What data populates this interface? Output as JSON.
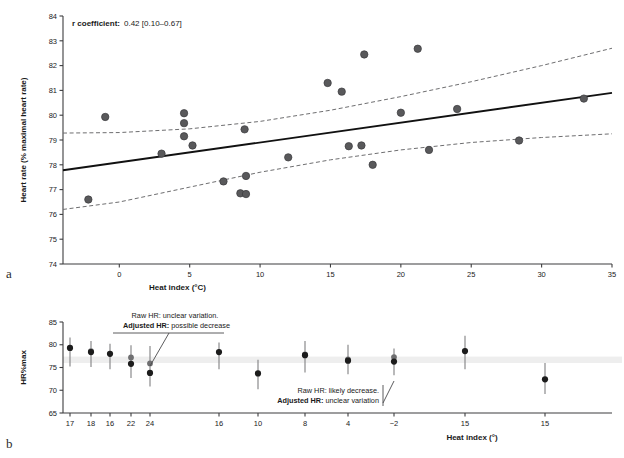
{
  "figure": {
    "panel_a_label": "a",
    "panel_b_label": "b"
  },
  "panel_a": {
    "stat_label": "r coefficient:",
    "stat_value": "0.42 [0.10–0.67]",
    "ylabel": "Heart rate (% maximal heart rate)",
    "xlabel": "Heat index (°C)",
    "yticks": [
      "74",
      "75",
      "76",
      "77",
      "78",
      "79",
      "80",
      "81",
      "82",
      "83",
      "84"
    ],
    "xticks": [
      "0",
      "5",
      "10",
      "15",
      "20",
      "25",
      "30",
      "35"
    ],
    "colors": {
      "point": "#59595b",
      "point_edge": "#3a3a3c",
      "fit_line": "#111111",
      "ci_line": "#6e6e70",
      "axis": "#3d3d3f"
    }
  },
  "panel_b": {
    "ylabel": "HR%max",
    "xlabel": "Heat index (°)",
    "yticks": [
      "65",
      "70",
      "75",
      "80",
      "85"
    ],
    "xticks": [
      "17",
      "18",
      "16",
      "22",
      "24",
      "16",
      "10",
      "8",
      "4",
      "−2",
      "15",
      "15"
    ],
    "annotation_1": {
      "line1": "Raw HR: unclear variation.",
      "line2_bold": "Adjusted HR:",
      "line2_rest": " possible decrease"
    },
    "annotation_2": {
      "line1": "Raw HR: likely decrease.",
      "line2_bold": "Adjusted HR:",
      "line2_rest": " unclear variation"
    },
    "colors": {
      "raw_point": "#1c1c1c",
      "adjusted_point": "#6f6f71",
      "whisker": "#8a8a8c",
      "band": "#eeeeee",
      "axis": "#3d3d3f"
    }
  },
  "chart_data": [
    {
      "type": "scatter",
      "title": "",
      "xlabel": "Heat index (°C)",
      "ylabel": "Heart rate (% maximal heart rate)",
      "xlim": [
        -4,
        35
      ],
      "ylim": [
        74,
        84
      ],
      "grid": false,
      "annotation": "r coefficient: 0.42 [0.10–0.67]",
      "points": [
        {
          "x": -2.2,
          "y": 76.6
        },
        {
          "x": -1.0,
          "y": 79.93
        },
        {
          "x": 3.0,
          "y": 78.45
        },
        {
          "x": 4.6,
          "y": 80.08
        },
        {
          "x": 4.6,
          "y": 79.68
        },
        {
          "x": 4.6,
          "y": 79.15
        },
        {
          "x": 5.2,
          "y": 78.78
        },
        {
          "x": 7.4,
          "y": 77.33
        },
        {
          "x": 8.6,
          "y": 76.85
        },
        {
          "x": 8.9,
          "y": 79.43
        },
        {
          "x": 9.0,
          "y": 77.55
        },
        {
          "x": 9.0,
          "y": 76.82
        },
        {
          "x": 12.0,
          "y": 78.3
        },
        {
          "x": 14.8,
          "y": 81.3
        },
        {
          "x": 15.8,
          "y": 80.95
        },
        {
          "x": 16.3,
          "y": 78.75
        },
        {
          "x": 17.2,
          "y": 78.78
        },
        {
          "x": 17.4,
          "y": 82.45
        },
        {
          "x": 18.0,
          "y": 78.0
        },
        {
          "x": 20.0,
          "y": 80.1
        },
        {
          "x": 21.2,
          "y": 82.68
        },
        {
          "x": 22.0,
          "y": 78.6
        },
        {
          "x": 24.0,
          "y": 80.25
        },
        {
          "x": 28.4,
          "y": 78.98
        },
        {
          "x": 33.0,
          "y": 80.67
        }
      ],
      "fit_line": {
        "name": "regression",
        "x": [
          -4,
          35
        ],
        "y": [
          77.78,
          80.9
        ]
      },
      "ci_upper": {
        "name": "upper 95% CI",
        "x": [
          -4,
          0,
          5,
          10,
          15,
          20,
          25,
          30,
          35
        ],
        "y": [
          79.28,
          79.3,
          79.45,
          79.75,
          80.2,
          80.75,
          81.35,
          82.0,
          82.7
        ]
      },
      "ci_lower": {
        "name": "lower 95% CI",
        "x": [
          -4,
          0,
          5,
          10,
          15,
          20,
          25,
          30,
          35
        ],
        "y": [
          76.2,
          76.5,
          77.1,
          77.7,
          78.2,
          78.6,
          78.9,
          79.1,
          79.25
        ]
      }
    },
    {
      "type": "scatter",
      "title": "",
      "xlabel": "Heat index (°)",
      "ylabel": "HR%max",
      "xlim": [
        0,
        12
      ],
      "ylim": [
        65,
        85
      ],
      "grid": false,
      "reference_band": [
        76.0,
        77.4
      ],
      "categories": [
        "17",
        "18",
        "16",
        "22",
        "24",
        "16",
        "10",
        "8",
        "4",
        "−2",
        "15",
        "15"
      ],
      "series": [
        {
          "name": "Raw HR",
          "values": [
            79.3,
            78.4,
            78.0,
            75.8,
            73.8,
            78.4,
            73.7,
            77.7,
            76.5,
            76.3,
            78.6,
            72.4
          ],
          "err_low": [
            75.2,
            75.1,
            74.6,
            72.7,
            70.8,
            74.6,
            70.2,
            73.9,
            73.5,
            73.3,
            74.6,
            69.2
          ],
          "err_high": [
            81.6,
            80.8,
            80.2,
            79.9,
            79.7,
            80.5,
            76.7,
            80.8,
            80.0,
            79.2,
            82.0,
            76.0
          ]
        },
        {
          "name": "Adjusted HR",
          "values": [
            79.3,
            78.6,
            78.0,
            77.2,
            75.9,
            78.4,
            73.7,
            77.9,
            76.8,
            77.3,
            78.6,
            72.4
          ],
          "err_low": [
            75.2,
            75.1,
            74.6,
            72.7,
            70.8,
            74.6,
            70.2,
            73.9,
            73.5,
            73.3,
            74.6,
            69.2
          ],
          "err_high": [
            81.6,
            80.8,
            80.2,
            79.9,
            79.7,
            80.5,
            76.7,
            80.8,
            80.0,
            79.2,
            82.0,
            76.0
          ]
        }
      ],
      "annotations": [
        "Raw HR: unclear variation. Adjusted HR: possible decrease",
        "Raw HR: likely decrease. Adjusted HR: unclear variation"
      ]
    }
  ]
}
